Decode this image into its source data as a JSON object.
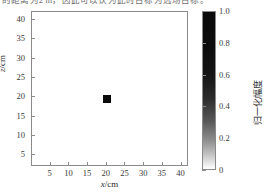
{
  "top_partial_text": "的距离为2 m，因此可以认为此时目标为远场目标。",
  "chart_data": {
    "type": "heatmap",
    "title": "",
    "xlabel": "x/cm",
    "ylabel": "z/cm",
    "xlim": [
      0,
      42
    ],
    "ylim": [
      42,
      2
    ],
    "y_inverted": true,
    "grid": false,
    "xticks": [
      5,
      10,
      15,
      20,
      25,
      30,
      35,
      40
    ],
    "xticklabels": [
      "5",
      "10",
      "15",
      "20",
      "25",
      "30",
      "35",
      "40"
    ],
    "yticks": [
      5,
      10,
      15,
      20,
      25,
      30,
      35,
      40
    ],
    "yticklabels": [
      "5",
      "10",
      "15",
      "20",
      "25",
      "30",
      "35",
      "40"
    ],
    "colorbar": {
      "label": "归一化幅度",
      "ticks": [
        1.0,
        0.8,
        0.6,
        0.4,
        0.2,
        0
      ],
      "ticklabels": [
        "1.0",
        "0.8",
        "0.6",
        "0.4",
        "0.2",
        "0"
      ],
      "vmin": 0,
      "vmax": 1.0,
      "cmap": "gray_reversed",
      "top_color": "#0a0a0a",
      "bottom_color": "#ffffff"
    },
    "points": [
      {
        "x": 20,
        "z": 19.5,
        "value": 1.0,
        "color": "#0a0a0a",
        "width_cm": 2.2,
        "height_cm": 2.0
      }
    ]
  }
}
